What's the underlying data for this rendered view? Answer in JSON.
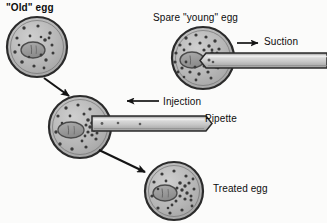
{
  "figure": {
    "background_color": "#fbfbfa",
    "ink_color": "#141414",
    "cell_fill": "#b4b4b4",
    "cell_stroke": "#2b2b2b",
    "nucleus_fill": "#9a9a9a",
    "granule_color": "#3a3a3a",
    "pipette_fill": "#c8c8c8",
    "pipette_stroke": "#2b2b2b"
  },
  "labels": {
    "old_egg": "\"Old\" egg",
    "spare_egg": "Spare \"young\" egg",
    "suction": "Suction",
    "injection": "Injection",
    "pipette": "Pipette",
    "treated_egg": "Treated egg"
  },
  "cells": [
    {
      "id": "old-egg",
      "name": "old-egg-cell",
      "cx": 37,
      "cy": 47,
      "r": 30,
      "nucleus_cx": 33,
      "nucleus_cy": 50,
      "nucleus_rx": 12,
      "nucleus_ry": 8,
      "granule_count": 16,
      "description": "Aged oocyte with sparse cytoplasmic granules"
    },
    {
      "id": "spare-young-egg",
      "name": "spare-young-egg-cell",
      "cx": 203,
      "cy": 58,
      "r": 31,
      "nucleus_cx": 192,
      "nucleus_cy": 60,
      "nucleus_rx": 12,
      "nucleus_ry": 8,
      "granule_count": 44,
      "description": "Young donor oocyte rich in cytoplasmic granules"
    },
    {
      "id": "recipient-egg",
      "name": "recipient-egg-cell",
      "cx": 80,
      "cy": 127,
      "r": 31,
      "nucleus_cx": 72,
      "nucleus_cy": 130,
      "nucleus_rx": 13,
      "nucleus_ry": 8,
      "granule_count": 26,
      "description": "Old egg receiving injected young ooplasm"
    },
    {
      "id": "treated-egg",
      "name": "treated-egg-cell",
      "cx": 174,
      "cy": 191,
      "r": 29,
      "nucleus_cx": 165,
      "nucleus_cy": 194,
      "nucleus_rx": 12,
      "nucleus_ry": 8,
      "granule_count": 30,
      "description": "Resulting treated egg with transferred granules"
    }
  ],
  "pipettes": [
    {
      "id": "suction-pipette",
      "name": "suction-pipette",
      "tip_x": 207,
      "y_top": 53,
      "y_bottom": 68,
      "end_x": 327,
      "direction": "right",
      "action": "Suction"
    },
    {
      "id": "injection-pipette",
      "name": "injection-pipette",
      "tip_x": 86,
      "y_top": 116,
      "y_bottom": 131,
      "end_x": 212,
      "direction": "right",
      "action": "Injection"
    }
  ],
  "arrows": [
    {
      "id": "arrow-old-to-recipient",
      "name": "flow-arrow-old-to-recipient",
      "x1": 44,
      "y1": 78,
      "x2": 71,
      "y2": 97
    },
    {
      "id": "arrow-recipient-to-treated",
      "name": "flow-arrow-recipient-to-treated",
      "x1": 99,
      "y1": 150,
      "x2": 147,
      "y2": 173
    },
    {
      "id": "arrow-suction",
      "name": "suction-direction-arrow",
      "x1": 237,
      "y1": 43,
      "x2": 260,
      "y2": 43
    },
    {
      "id": "arrow-injection",
      "name": "injection-pointer-arrow",
      "x1": 159,
      "y1": 101,
      "x2": 125,
      "y2": 101
    }
  ]
}
